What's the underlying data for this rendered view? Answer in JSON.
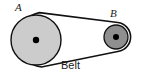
{
  "figure": {
    "kind": "mechanical-diagram",
    "width": 141,
    "height": 73,
    "background_color": "#ffffff"
  },
  "labels": {
    "pulley_a": "A",
    "pulley_b": "B",
    "belt": "Belt"
  },
  "colors": {
    "outline": "#111111",
    "pulley_a_fill": "#cccccc",
    "pulley_b_fill": "#8f8f8f",
    "hub_fill": "#000000",
    "belt_fill": "#ffffff",
    "label_color": "#1a1a1a"
  },
  "geometry": {
    "pulley_a": {
      "name": "A",
      "center_x": 36,
      "center_y": 40,
      "radius": 25,
      "hub_radius": 3.2,
      "size": "large"
    },
    "pulley_b": {
      "name": "B",
      "center_x": 116,
      "center_y": 37,
      "radius": 12,
      "hub_radius": 3.0,
      "size": "small"
    },
    "belt": {
      "outer_path": "M 11.6 42.6 A 27.5 27.5 0 0 1 36.9 12.6 L 113.9 23.4 A 14.5 14.5 0 0 1 123.9 48.9 L 122.0 50.1 A 14.5 14.5 0 0 1 110.9 50.9 L 36.0 67.5 A 27.5 27.5 0 0 1 11.6 42.6 Z",
      "upper_run_start_x": 38,
      "upper_run_start_y": 14,
      "upper_run_end_x": 116,
      "upper_run_end_y": 25,
      "lower_run_start_x": 35,
      "lower_run_start_y": 64,
      "lower_run_end_x": 122,
      "lower_run_end_y": 48,
      "stroke_width": 1.6
    }
  }
}
